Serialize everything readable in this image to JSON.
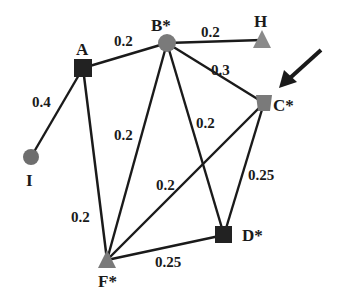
{
  "graph": {
    "colors": {
      "black_node": "#222222",
      "gray_node": "#7a7a7a",
      "edge": "#1a1a1a",
      "arrow": "#1a1a1a"
    },
    "nodes": [
      {
        "id": "A",
        "label": "A",
        "shape": "square",
        "color": "black",
        "x": 83,
        "y": 68
      },
      {
        "id": "B",
        "label": "B*",
        "shape": "circle",
        "color": "gray",
        "x": 167,
        "y": 43
      },
      {
        "id": "H",
        "label": "H",
        "shape": "triangle",
        "color": "gray",
        "x": 262,
        "y": 40
      },
      {
        "id": "C",
        "label": "C*",
        "shape": "square",
        "color": "gray",
        "x": 264,
        "y": 103
      },
      {
        "id": "I",
        "label": "I",
        "shape": "circle",
        "color": "gray",
        "x": 31,
        "y": 157
      },
      {
        "id": "F",
        "label": "F*",
        "shape": "triangle",
        "color": "gray",
        "x": 107,
        "y": 260
      },
      {
        "id": "D",
        "label": "D*",
        "shape": "square",
        "color": "black",
        "x": 224,
        "y": 235
      }
    ],
    "edges": [
      {
        "from": "I",
        "to": "A",
        "weight": "0.4"
      },
      {
        "from": "A",
        "to": "B",
        "weight": "0.2"
      },
      {
        "from": "B",
        "to": "H",
        "weight": "0.2"
      },
      {
        "from": "B",
        "to": "C",
        "weight": "0.3"
      },
      {
        "from": "B",
        "to": "F",
        "weight": "0.2"
      },
      {
        "from": "B",
        "to": "D",
        "weight": "0.2"
      },
      {
        "from": "A",
        "to": "F",
        "weight": "0.2"
      },
      {
        "from": "C",
        "to": "F",
        "weight": "0.2"
      },
      {
        "from": "C",
        "to": "D",
        "weight": "0.25"
      },
      {
        "from": "F",
        "to": "D",
        "weight": "0.25"
      }
    ],
    "labels": {
      "A": "A",
      "B": "B*",
      "H": "H",
      "C": "C*",
      "I": "I",
      "F": "F*",
      "D": "D*",
      "w_IA": "0.4",
      "w_AB": "0.2",
      "w_BH": "0.2",
      "w_BC": "0.3",
      "w_BF": "0.2",
      "w_BD": "0.2",
      "w_AF": "0.2",
      "w_CF": "0.2",
      "w_CD": "0.25",
      "w_FD": "0.25"
    },
    "annotation": {
      "type": "arrow",
      "points_to": "C"
    }
  }
}
